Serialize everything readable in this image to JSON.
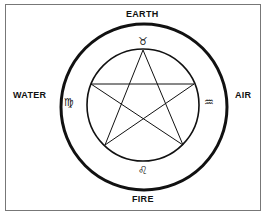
{
  "labels": {
    "top": "EARTH",
    "left": "WATER",
    "right": "AIR",
    "bottom": "FIRE"
  },
  "symbols": {
    "top": "♉",
    "left": "♍",
    "right": "♒",
    "bottom": "♌"
  },
  "colors": {
    "ink": "#111111",
    "frame": "#777777",
    "background": "#ffffff"
  }
}
